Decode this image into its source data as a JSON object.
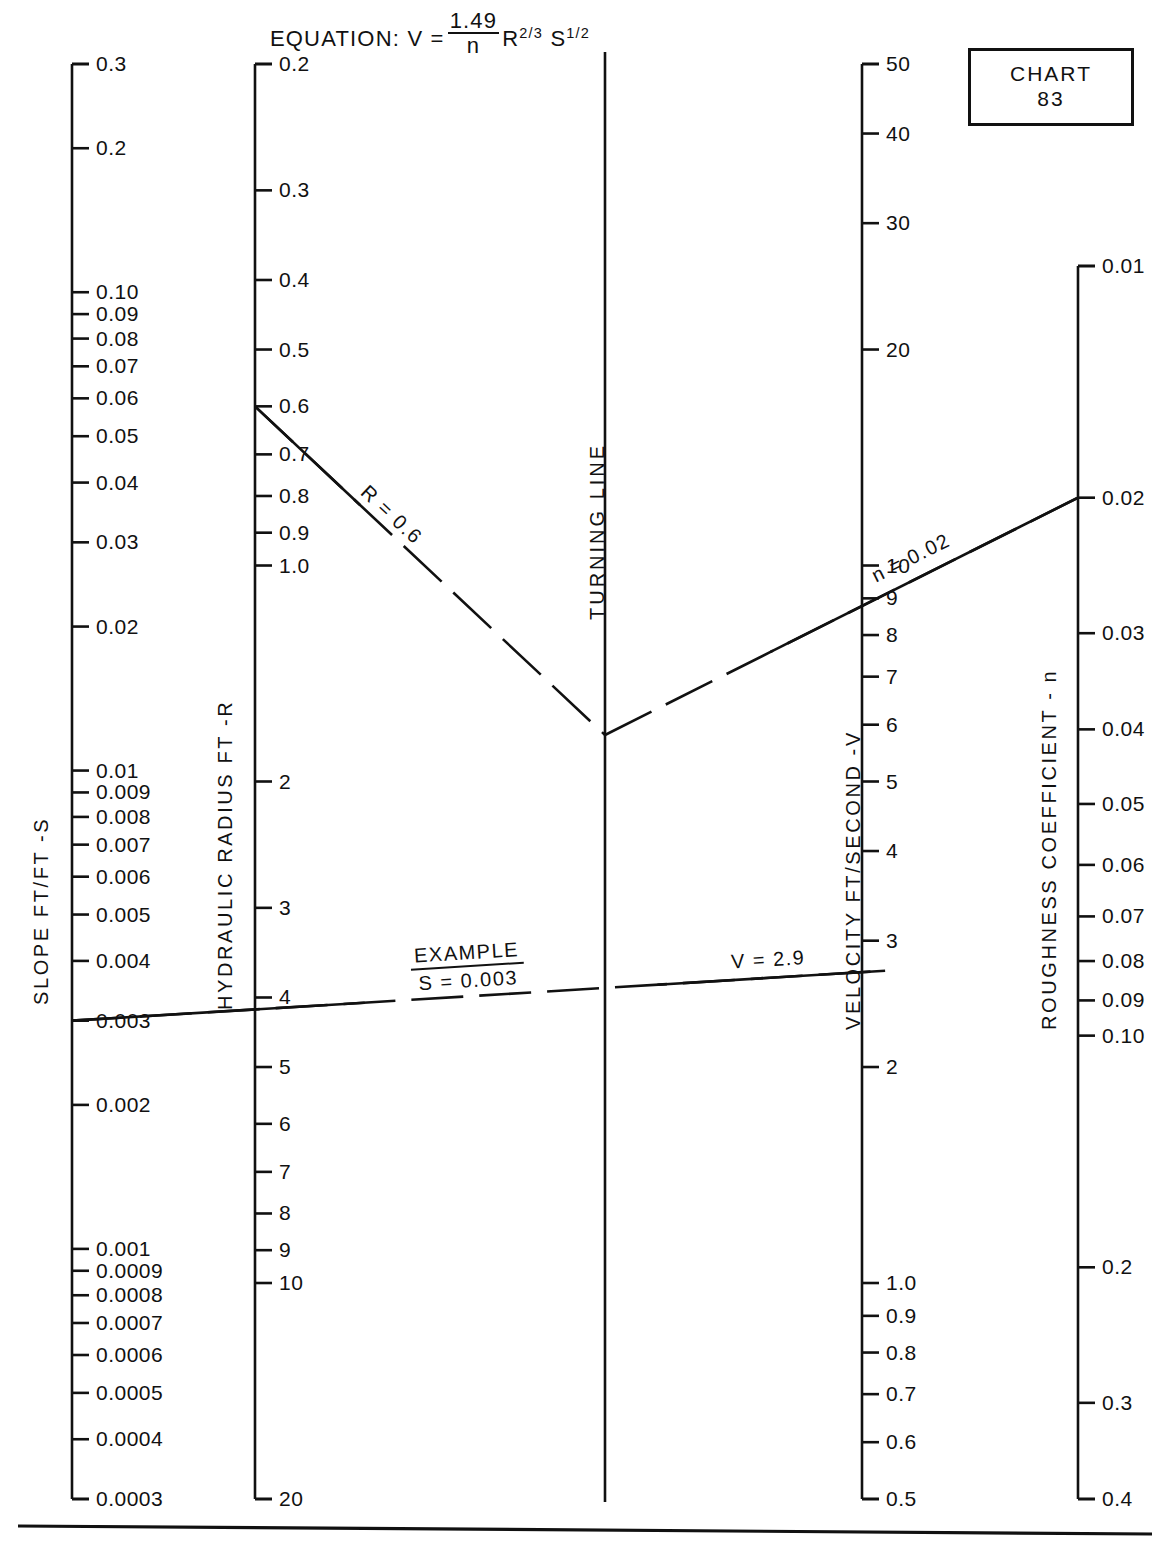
{
  "header": {
    "equation_prefix": "EQUATION:  V =",
    "equation_numerator": "1.49",
    "equation_denominator": "n",
    "equation_R": "R",
    "equation_R_exp": "2/3",
    "equation_S": "S",
    "equation_S_exp": "1/2",
    "chart_word": "CHART",
    "chart_number": "83"
  },
  "turning_line_label": "TURNING LINE",
  "chart_data": {
    "type": "nomograph",
    "chart_id": "CHART 83",
    "scales": [
      {
        "key": "slope",
        "label": "SLOPE  FT/FT  -S",
        "orientation": "log-decreasing-down",
        "min": 0.0003,
        "max": 0.3,
        "labeled_ticks": [
          "0.3",
          "0.2",
          "0.10",
          "0.09",
          "0.08",
          "0.07",
          "0.06",
          "0.05",
          "0.04",
          "0.03",
          "0.02",
          "0.01",
          "0.009",
          "0.008",
          "0.007",
          "0.006",
          "0.005",
          "0.004",
          "0.003",
          "0.002",
          "0.001",
          "0.0009",
          "0.0008",
          "0.0007",
          "0.0006",
          "0.0005",
          "0.0004",
          "0.0003"
        ],
        "labeled_values": [
          0.3,
          0.2,
          0.1,
          0.09,
          0.08,
          0.07,
          0.06,
          0.05,
          0.04,
          0.03,
          0.02,
          0.01,
          0.009,
          0.008,
          0.007,
          0.006,
          0.005,
          0.004,
          0.003,
          0.002,
          0.001,
          0.0009,
          0.0008,
          0.0007,
          0.0006,
          0.0005,
          0.0004,
          0.0003
        ]
      },
      {
        "key": "hydraulic_radius",
        "label": "HYDRAULIC  RADIUS  FT  -R",
        "orientation": "log-increasing-down",
        "min": 0.2,
        "max": 20,
        "labeled_ticks": [
          "0.2",
          "0.3",
          "0.4",
          "0.5",
          "0.6",
          "0.7",
          "0.8",
          "0.9",
          "1.0",
          "2",
          "3",
          "4",
          "5",
          "6",
          "7",
          "8",
          "9",
          "10",
          "20"
        ],
        "labeled_values": [
          0.2,
          0.3,
          0.4,
          0.5,
          0.6,
          0.7,
          0.8,
          0.9,
          1.0,
          2,
          3,
          4,
          5,
          6,
          7,
          8,
          9,
          10,
          20
        ]
      },
      {
        "key": "velocity",
        "label": "VELOCITY  FT/SECOND  -V",
        "orientation": "log-decreasing-down",
        "min": 0.5,
        "max": 50,
        "labeled_ticks": [
          "50",
          "40",
          "30",
          "20",
          "10",
          "9",
          "8",
          "7",
          "6",
          "5",
          "4",
          "3",
          "2",
          "1.0",
          "0.9",
          "0.8",
          "0.7",
          "0.6",
          "0.5"
        ],
        "labeled_values": [
          50,
          40,
          30,
          20,
          10,
          9,
          8,
          7,
          6,
          5,
          4,
          3,
          2,
          1.0,
          0.9,
          0.8,
          0.7,
          0.6,
          0.5
        ]
      },
      {
        "key": "roughness",
        "label": "ROUGHNESS  COEFFICIENT - n",
        "orientation": "log-increasing-down",
        "min": 0.01,
        "max": 0.4,
        "labeled_ticks": [
          "0.01",
          "0.02",
          "0.03",
          "0.04",
          "0.05",
          "0.06",
          "0.07",
          "0.08",
          "0.09",
          "0.10",
          "0.2",
          "0.3",
          "0.4"
        ],
        "labeled_values": [
          0.01,
          0.02,
          0.03,
          0.04,
          0.05,
          0.06,
          0.07,
          0.08,
          0.09,
          0.1,
          0.2,
          0.3,
          0.4
        ]
      }
    ],
    "example": {
      "label": "EXAMPLE",
      "slope_text": "S = 0.003",
      "radius_text": "R = 0.6",
      "velocity_text": "V = 2.9",
      "roughness_text": "n = 0.02",
      "slope_value": 0.003,
      "radius_value": 0.6,
      "velocity_value": 2.9,
      "roughness_value": 0.02
    }
  }
}
